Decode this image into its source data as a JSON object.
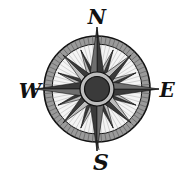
{
  "image": {
    "subject": "compass rose",
    "cardinals": {
      "north": "N",
      "east": "E",
      "south": "S",
      "west": "W"
    },
    "point_count": 16,
    "colors": {
      "ink": "#111111",
      "dark_fill": "#3a3a3a",
      "mid_fill": "#6e6e6e",
      "light_fill": "#bdbdbd",
      "ring_fill": "#9a9a9a",
      "background": "#ffffff"
    }
  }
}
